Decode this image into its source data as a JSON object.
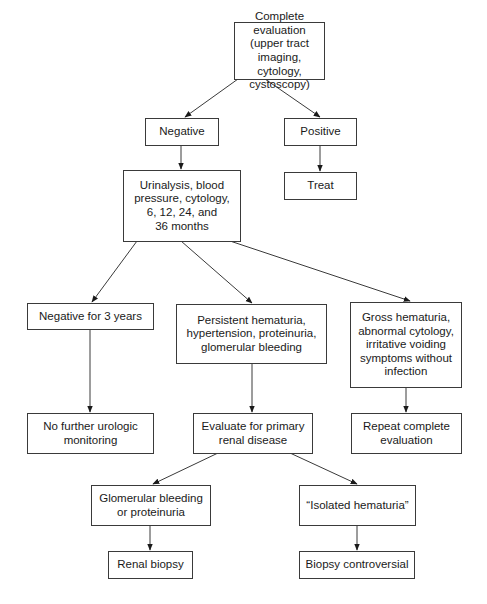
{
  "diagram": {
    "type": "flowchart",
    "nodes": {
      "complete_eval": "Complete evaluation\n(upper tract imaging,\ncytology, cystoscopy)",
      "negative": "Negative",
      "positive": "Positive",
      "urinalysis": "Urinalysis, blood\npressure, cytology,\n6, 12, 24, and\n36 months",
      "treat": "Treat",
      "negative_3y": "Negative for 3 years",
      "persistent": "Persistent hematuria,\nhypertension, proteinuria,\nglomerular bleeding",
      "gross": "Gross hematuria,\nabnormal cytology,\nirritative voiding\nsymptoms without\ninfection",
      "no_further": "No further urologic\nmonitoring",
      "evaluate_renal": "Evaluate for primary\nrenal disease",
      "repeat_eval": "Repeat complete\nevaluation",
      "glomerular": "Glomerular bleeding\nor proteinuria",
      "isolated": "“Isolated hematuria”",
      "renal_biopsy": "Renal biopsy",
      "biopsy_controversial": "Biopsy controversial"
    },
    "edges": [
      [
        "complete_eval",
        "negative"
      ],
      [
        "complete_eval",
        "positive"
      ],
      [
        "negative",
        "urinalysis"
      ],
      [
        "positive",
        "treat"
      ],
      [
        "urinalysis",
        "negative_3y"
      ],
      [
        "urinalysis",
        "persistent"
      ],
      [
        "urinalysis",
        "gross"
      ],
      [
        "negative_3y",
        "no_further"
      ],
      [
        "persistent",
        "evaluate_renal"
      ],
      [
        "gross",
        "repeat_eval"
      ],
      [
        "evaluate_renal",
        "glomerular"
      ],
      [
        "evaluate_renal",
        "isolated"
      ],
      [
        "glomerular",
        "renal_biopsy"
      ],
      [
        "isolated",
        "biopsy_controversial"
      ]
    ]
  }
}
